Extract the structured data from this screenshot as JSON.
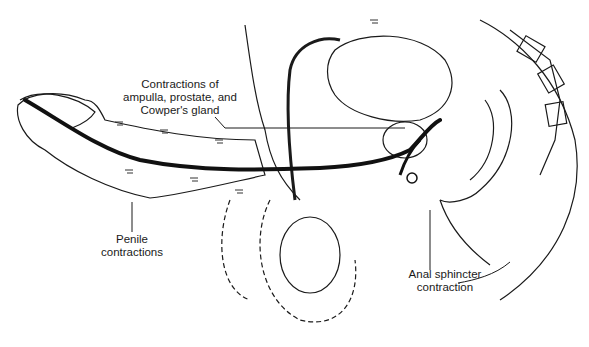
{
  "figure": {
    "type": "anatomical-illustration",
    "style": "black-and-white line drawing",
    "colors": {
      "background": "#ffffff",
      "ink": "#1a1a1a",
      "urethra": "#111111"
    },
    "labels": {
      "ampulla": {
        "line1": "Contractions of",
        "line2": "ampulla, prostate, and",
        "line3": "Cowper's gland"
      },
      "penile": {
        "line1": "Penile",
        "line2": "contractions"
      },
      "anal": {
        "line1": "Anal sphincter",
        "line2": "contraction"
      }
    }
  }
}
